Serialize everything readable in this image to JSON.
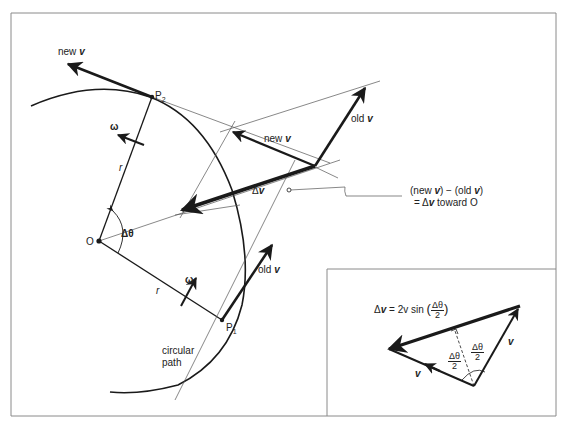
{
  "figure": {
    "main_panel": {
      "labels": {
        "new_v_top": {
          "prefix": "new",
          "vec": "v"
        },
        "p2": {
          "main": "P",
          "sub": "2"
        },
        "omega_top": "ω",
        "r_top": "r",
        "new_v_mid": {
          "prefix": "new",
          "vec": "v"
        },
        "old_v_top": {
          "prefix": "old",
          "vec": "v"
        },
        "delta_v": {
          "prefix": "Δ",
          "vec": "v"
        },
        "origin": "O",
        "delta_theta": "Δθ",
        "omega_bottom": "ω",
        "r_bottom": "r",
        "old_v_bottom": {
          "prefix": "old",
          "vec": "v"
        },
        "p1": {
          "main": "P",
          "sub": "1"
        },
        "circular_path_line1": "circular",
        "circular_path_line2": "path"
      },
      "annotation": {
        "line1_a": "(new ",
        "line1_vec_a": "v",
        "line1_b": ")  −  (old ",
        "line1_vec_b": "v",
        "line1_c": ")",
        "line2_eq": "=  Δ",
        "line2_vec": "v",
        "line2_rest": " toward O"
      }
    },
    "inset_panel": {
      "equation": {
        "lhs_prefix": "Δ",
        "lhs_vec": "v",
        "rhs": " = 2v sin ",
        "frac_num": "Δθ",
        "frac_den": "2"
      },
      "labels": {
        "half_angle_left_num": "Δθ",
        "half_angle_left_den": "2",
        "half_angle_right_num": "Δθ",
        "half_angle_right_den": "2",
        "v_right": "v",
        "v_left": "v"
      }
    },
    "colors": {
      "ink": "#1a1a1a",
      "thin_line": "#555555",
      "frame": "#8a8a8a",
      "background": "#ffffff"
    }
  }
}
